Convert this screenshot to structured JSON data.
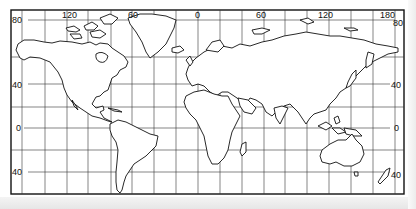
{
  "map": {
    "type": "world map",
    "projection": "Mercator-style rectangular grid",
    "longitude_labels": [
      {
        "text": "120",
        "x": 70
      },
      {
        "text": "60",
        "x": 134
      },
      {
        "text": "0",
        "x": 198
      },
      {
        "text": "60",
        "x": 262
      },
      {
        "text": "120",
        "x": 326
      },
      {
        "text": "180",
        "x": 388
      }
    ],
    "latitude_labels_left": [
      {
        "text": "80",
        "y": 21
      },
      {
        "text": "40",
        "y": 85
      },
      {
        "text": "0",
        "y": 129
      },
      {
        "text": "40",
        "y": 173
      }
    ],
    "latitude_labels_right": [
      {
        "text": "80",
        "y": 24
      },
      {
        "text": "40",
        "y": 85
      },
      {
        "text": "0",
        "y": 129
      },
      {
        "text": "40",
        "y": 175
      }
    ],
    "colors": {
      "line": "#1a1a1a",
      "grid": "#2a2a2a",
      "background": "#ffffff"
    }
  }
}
